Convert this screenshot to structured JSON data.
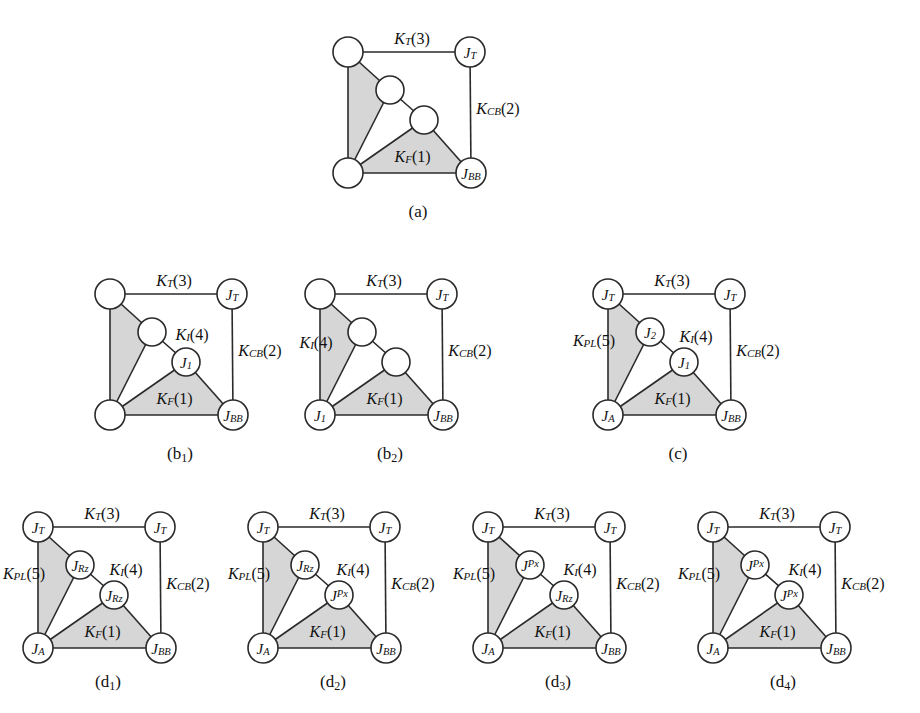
{
  "figure": {
    "shade_color": "#d6d6d6",
    "line_color": "#2a2a2a",
    "node_fill": "#ffffff"
  },
  "edge_labels": {
    "k_t": "K_T(3)",
    "k_cb": "K_CB(2)",
    "k_f": "K_F(1)",
    "k_i": "K_I(4)",
    "k_pl": "K_PL(5)"
  },
  "diagrams": [
    {
      "id": "a",
      "caption": "(a)",
      "caption_sub": "",
      "nodes": {
        "top_left": "",
        "top_right": "J_T",
        "mid_upper": "",
        "mid_lower": "",
        "bottom_left": "",
        "bottom_right": "J_BB"
      },
      "labels": {
        "k_t": "K_T(3)",
        "k_cb": "K_CB(2)",
        "k_f": "K_F(1)",
        "k_i": "",
        "k_pl": ""
      }
    },
    {
      "id": "b1",
      "caption": "(b",
      "caption_sub": "1",
      "nodes": {
        "top_left": "",
        "top_right": "J_T",
        "mid_upper": "",
        "mid_lower": "J_1",
        "bottom_left": "",
        "bottom_right": "J_BB"
      },
      "labels": {
        "k_t": "K_T(3)",
        "k_cb": "K_CB(2)",
        "k_f": "K_F(1)",
        "k_i": "K_I(4)",
        "k_pl": ""
      }
    },
    {
      "id": "b2",
      "caption": "(b",
      "caption_sub": "2",
      "nodes": {
        "top_left": "",
        "top_right": "J_T",
        "mid_upper": "",
        "mid_lower": "",
        "bottom_left": "J_1",
        "bottom_right": "J_BB"
      },
      "labels": {
        "k_t": "K_T(3)",
        "k_cb": "K_CB(2)",
        "k_f": "K_F(1)",
        "k_i": "K_I(4)",
        "k_pl": ""
      }
    },
    {
      "id": "c",
      "caption": "(c)",
      "caption_sub": "",
      "nodes": {
        "top_left": "J_T",
        "top_right": "J_T",
        "mid_upper": "J_2",
        "mid_lower": "J_1",
        "bottom_left": "J_A",
        "bottom_right": "J_BB"
      },
      "labels": {
        "k_t": "K_T(3)",
        "k_cb": "K_CB(2)",
        "k_f": "K_F(1)",
        "k_i": "K_I(4)",
        "k_pl": "K_PL(5)"
      }
    },
    {
      "id": "d1",
      "caption": "(d",
      "caption_sub": "1",
      "nodes": {
        "top_left": "J_T",
        "top_right": "J_T",
        "mid_upper": "J_Rz",
        "mid_lower": "J_Rz",
        "bottom_left": "J_A",
        "bottom_right": "J_BB"
      },
      "labels": {
        "k_t": "K_T(3)",
        "k_cb": "K_CB(2)",
        "k_f": "K_F(1)",
        "k_i": "K_I(4)",
        "k_pl": "K_PL(5)"
      }
    },
    {
      "id": "d2",
      "caption": "(d",
      "caption_sub": "2",
      "nodes": {
        "top_left": "J_T",
        "top_right": "J_T",
        "mid_upper": "J_Rz",
        "mid_lower": "J^Px",
        "bottom_left": "J_A",
        "bottom_right": "J_BB"
      },
      "labels": {
        "k_t": "K_T(3)",
        "k_cb": "K_CB(2)",
        "k_f": "K_F(1)",
        "k_i": "K_I(4)",
        "k_pl": "K_PL(5)"
      }
    },
    {
      "id": "d3",
      "caption": "(d",
      "caption_sub": "3",
      "nodes": {
        "top_left": "J_T",
        "top_right": "J_T",
        "mid_upper": "J^Px",
        "mid_lower": "J_Rz",
        "bottom_left": "J_A",
        "bottom_right": "J_BB"
      },
      "labels": {
        "k_t": "K_T(3)",
        "k_cb": "K_CB(2)",
        "k_f": "K_F(1)",
        "k_i": "K_I(4)",
        "k_pl": "K_PL(5)"
      }
    },
    {
      "id": "d4",
      "caption": "(d",
      "caption_sub": "4",
      "nodes": {
        "top_left": "J_T",
        "top_right": "J_T",
        "mid_upper": "J^Px",
        "mid_lower": "J^Px",
        "bottom_left": "J_A",
        "bottom_right": "J_BB"
      },
      "labels": {
        "k_t": "K_T(3)",
        "k_cb": "K_CB(2)",
        "k_f": "K_F(1)",
        "k_i": "K_I(4)",
        "k_pl": "K_PL(5)"
      }
    }
  ]
}
